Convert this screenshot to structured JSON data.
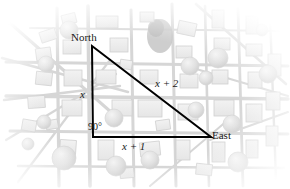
{
  "figure": {
    "type": "geometry-diagram"
  },
  "labels": {
    "north": "North",
    "east": "East",
    "right_angle": "90°",
    "leg_vertical": "x",
    "leg_horizontal": "x + 1",
    "hypotenuse": "x + 2"
  },
  "triangle": {
    "stroke_color": "#000000",
    "stroke_width": 2,
    "vertices": {
      "north": {
        "x": 92,
        "y": 46
      },
      "corner": {
        "x": 93,
        "y": 137
      },
      "east": {
        "x": 211,
        "y": 137
      }
    }
  },
  "map": {
    "background_color": "#ffffff",
    "road_color": "#d2d2d2",
    "building_fill": "#ededed",
    "building_stroke": "#cfcfcf",
    "tree_fill": "#e2e2e2",
    "park_fill": "#cccccc"
  }
}
